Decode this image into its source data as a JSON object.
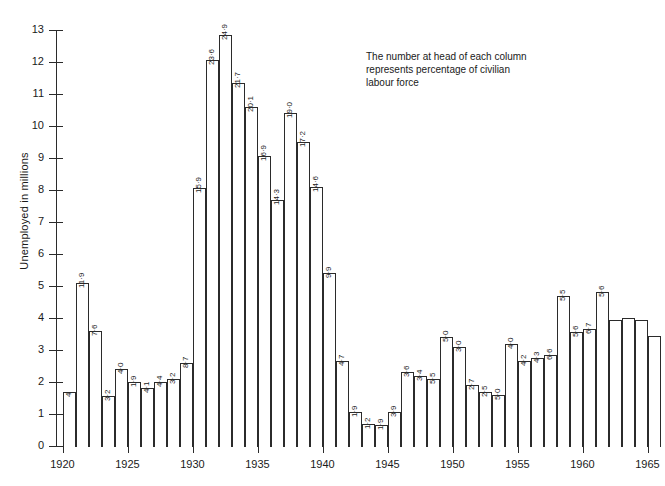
{
  "annotation": {
    "line1": "The number at head of each column",
    "line2": "represents percentage of civilian",
    "line3": " labour force"
  },
  "chart_data": {
    "type": "bar",
    "title": "",
    "xlabel": "",
    "ylabel": "Unemployed in millions",
    "ylim": [
      0,
      13
    ],
    "xlim": [
      1919.5,
      1966
    ],
    "grid": false,
    "legend": null,
    "yticks": [
      0,
      1,
      2,
      3,
      4,
      5,
      6,
      7,
      8,
      9,
      10,
      11,
      12,
      13
    ],
    "ytick_labels": [
      "0",
      "1",
      "2",
      "3",
      "4",
      "5",
      "6",
      "7",
      "8",
      "9",
      "10",
      "11",
      "12",
      "13"
    ],
    "xticks": [
      1920,
      1925,
      1930,
      1935,
      1940,
      1945,
      1950,
      1955,
      1960,
      1965
    ],
    "xtick_labels": [
      "1920",
      "1925",
      "1930",
      "1935",
      "1940",
      "1945",
      "1950",
      "1955",
      "1960",
      "1965"
    ],
    "categories": [
      1920,
      1921,
      1922,
      1923,
      1924,
      1925,
      1926,
      1927,
      1928,
      1929,
      1930,
      1931,
      1932,
      1933,
      1934,
      1935,
      1936,
      1937,
      1938,
      1939,
      1940,
      1941,
      1942,
      1943,
      1944,
      1945,
      1946,
      1947,
      1948,
      1949,
      1950,
      1951,
      1952,
      1953,
      1954,
      1955,
      1956,
      1957,
      1958,
      1959,
      1960,
      1961,
      1962,
      1963,
      1964,
      1965
    ],
    "values": [
      1.7,
      5.1,
      3.6,
      1.55,
      2.4,
      2.0,
      1.8,
      2.0,
      2.1,
      2.6,
      8.05,
      12.05,
      12.85,
      11.35,
      10.6,
      9.05,
      7.7,
      10.4,
      9.5,
      8.1,
      5.4,
      2.65,
      1.05,
      0.7,
      0.65,
      1.05,
      2.3,
      2.2,
      2.1,
      3.4,
      3.1,
      1.9,
      1.7,
      1.6,
      3.2,
      2.65,
      2.75,
      2.85,
      4.7,
      3.55,
      3.65,
      4.8,
      3.95,
      4.0,
      3.95,
      3.45
    ],
    "bar_labels": [
      "4",
      "11·9",
      "7·6",
      "3·2",
      "4·0",
      "1·9",
      "4·1",
      "4·4",
      "3·2",
      "8·7",
      "15·9",
      "23·6",
      "24·9",
      "21·7",
      "20·1",
      "16·9",
      "14·3",
      "19·0",
      "17·2",
      "14·6",
      "9·9",
      "4·7",
      "1·9",
      "1·2",
      "1·9",
      "3·9",
      "3·6",
      "3·4",
      "5·5",
      "5·0",
      "3·0",
      "2·7",
      "2·5",
      "5·0",
      "4·0",
      "4·2",
      "4·3",
      "6·6",
      "5·5",
      "5·6",
      "6·7",
      "5·6",
      "",
      "",
      "",
      ""
    ],
    "units": {
      "y": "millions",
      "bar_label": "percent of civilian labour force"
    }
  },
  "style": {
    "bar_fill": "#ffffff",
    "bar_stroke": "#2b2b2b",
    "axis_color": "#2b2b2b",
    "text_color": "#1a1a1a",
    "background": "#ffffff"
  }
}
